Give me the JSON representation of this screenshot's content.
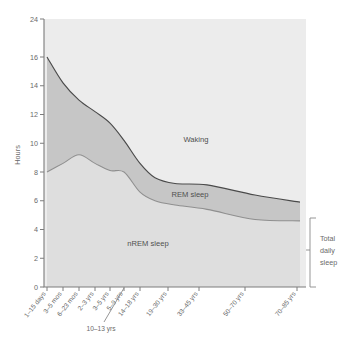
{
  "chart_data": {
    "type": "area",
    "title": "",
    "subtitle": "",
    "xlabel": "",
    "ylabel": "Hours",
    "ylim": [
      0,
      24
    ],
    "grid": false,
    "legend_position": "inline-labels",
    "y_ticks": [
      0,
      2,
      4,
      6,
      8,
      10,
      12,
      14,
      16,
      24
    ],
    "y_tick_labels": [
      "0",
      "2",
      "4",
      "6",
      "8",
      "10",
      "12",
      "14",
      "16",
      "24"
    ],
    "axis_note": "y-axis compressed between 16 and 24",
    "categories": [
      "1–15 days",
      "3–5 mos",
      "6–23 mos",
      "2–3 yrs",
      "3–5 yrs",
      "5–9 yrs",
      "10–13 yrs",
      "14–18 yrs",
      "19–30 yrs",
      "33–45 yrs",
      "50–70 yrs",
      "70–85 yrs"
    ],
    "series": [
      {
        "name": "Total daily sleep",
        "description": "Upper boundary: total sleep hours (top of REM band)",
        "values": [
          16.0,
          14.2,
          13.0,
          12.2,
          11.4,
          10.2,
          8.6,
          7.6,
          7.2,
          7.1,
          6.4,
          5.9
        ]
      },
      {
        "name": "nREM sleep",
        "description": "Lower boundary: nREM sleep hours (bottom of REM band)",
        "values": [
          8.0,
          8.6,
          9.2,
          8.6,
          8.1,
          8.0,
          6.6,
          6.0,
          5.7,
          5.4,
          4.7,
          4.6
        ]
      },
      {
        "name": "REM sleep",
        "description": "Band between the two curves",
        "values": [
          8.0,
          5.6,
          3.8,
          3.6,
          3.3,
          2.2,
          2.0,
          1.6,
          1.5,
          1.7,
          1.7,
          1.3
        ]
      }
    ],
    "region_labels": [
      {
        "name": "waking",
        "text": "Waking"
      },
      {
        "name": "rem",
        "text": "REM sleep"
      },
      {
        "name": "nrem",
        "text": "nREM sleep"
      }
    ],
    "annotations": [
      {
        "name": "total-daily-sleep",
        "text": "Total daily sleep",
        "lines": [
          "Total",
          "daily",
          "sleep"
        ]
      },
      {
        "name": "callout-10-13",
        "text": "10–13 yrs"
      }
    ],
    "colors": {
      "plot_background": "#e9e9e9",
      "rem_band": "#c6c6c6",
      "nrem_band": "#dedede",
      "waking": "#ececec",
      "upper_curve": "#4a4a4a",
      "lower_curve": "#8f8f8f",
      "axis": "#7c7c7c",
      "text": "#6a6a6a",
      "page_background": "#ffffff"
    }
  },
  "axes": {
    "y_title": "Hours",
    "y_labels": [
      "24",
      "16",
      "14",
      "12",
      "10",
      "8",
      "6",
      "4",
      "2",
      "0"
    ],
    "x_labels": [
      "1–15 days",
      "3–5 mos",
      "6–23 mos",
      "2–3 yrs",
      "3–5 yrs",
      "5–9 yrs",
      "14–18 yrs",
      "19–30 yrs",
      "33–45 yrs",
      "50–70 yrs",
      "70–85 yrs"
    ],
    "x_callout_label": "10–13 yrs"
  },
  "labels": {
    "waking": "Waking",
    "rem_sleep": "REM sleep",
    "nrem_sleep": "nREM sleep",
    "bracket_line1": "Total",
    "bracket_line2": "daily",
    "bracket_line3": "sleep"
  }
}
